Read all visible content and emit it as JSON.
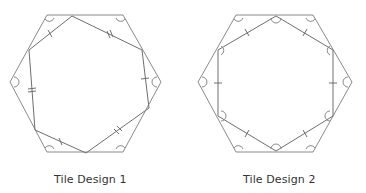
{
  "tiles": [
    {
      "label": "Tile Design 1",
      "outer_hexagon": [
        [
          47,
          15
        ],
        [
          123,
          15
        ],
        [
          161,
          82
        ],
        [
          123,
          152
        ],
        [
          47,
          152
        ],
        [
          10,
          82
        ]
      ],
      "inner_polygon": [
        [
          72,
          16
        ],
        [
          142,
          50
        ],
        [
          149,
          108
        ],
        [
          86,
          153
        ],
        [
          35,
          130
        ],
        [
          29,
          50
        ]
      ],
      "tick_marks": [
        "single",
        "double",
        "single",
        "double",
        "single",
        "double"
      ],
      "angle_marks_at_outer_vertices": true
    },
    {
      "label": "Tile Design 2",
      "outer_hexagon": [
        [
          236,
          15
        ],
        [
          313,
          15
        ],
        [
          352,
          82
        ],
        [
          313,
          152
        ],
        [
          236,
          152
        ],
        [
          198,
          82
        ]
      ],
      "inner_polygon": [
        [
          276,
          16
        ],
        [
          333,
          50
        ],
        [
          333,
          116
        ],
        [
          276,
          151
        ],
        [
          218,
          116
        ],
        [
          218,
          50
        ]
      ],
      "tick_marks": [
        "single",
        "single",
        "single",
        "single",
        "single",
        "single"
      ],
      "angle_marks_at_outer_vertices": true,
      "angle_marks_at_inner_vertices": true
    }
  ],
  "colors": {
    "stroke_outer": "#8a8a8a",
    "stroke_inner": "#6e6e6e",
    "text": "#333333"
  }
}
